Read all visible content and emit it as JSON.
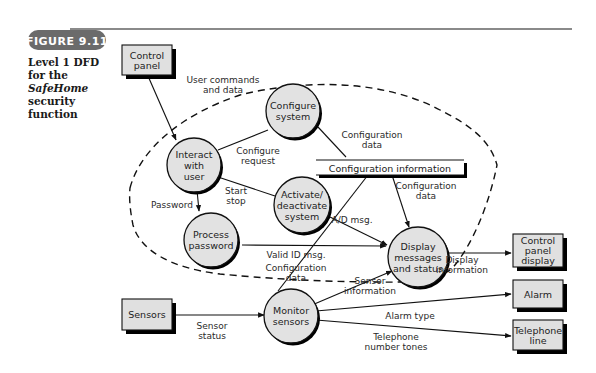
{
  "figure": {
    "badge": "FIGURE 9.11",
    "caption_prefix": "Level 1 DFD for the ",
    "caption_italic": "SafeHome",
    "caption_suffix": " security function"
  },
  "external_entities": [
    {
      "id": "control_panel",
      "lines": [
        "Control",
        "panel"
      ]
    },
    {
      "id": "sensors",
      "lines": [
        "Sensors"
      ]
    },
    {
      "id": "control_panel_display",
      "lines": [
        "Control",
        "panel",
        "display"
      ]
    },
    {
      "id": "alarm",
      "lines": [
        "Alarm"
      ]
    },
    {
      "id": "telephone_line",
      "lines": [
        "Telephone",
        "line"
      ]
    }
  ],
  "processes": [
    {
      "id": "interact_with_user",
      "lines": [
        "Interact",
        "with",
        "user"
      ]
    },
    {
      "id": "configure_system",
      "lines": [
        "Configure",
        "system"
      ]
    },
    {
      "id": "activate_deactivate_system",
      "lines": [
        "Activate/",
        "deactivate",
        "system"
      ]
    },
    {
      "id": "process_password",
      "lines": [
        "Process",
        "password"
      ]
    },
    {
      "id": "display_messages_and_status",
      "lines": [
        "Display",
        "messages",
        "and status"
      ]
    },
    {
      "id": "monitor_sensors",
      "lines": [
        "Monitor",
        "sensors"
      ]
    }
  ],
  "data_store": {
    "id": "configuration_information",
    "label": "Configuration information"
  },
  "flows": [
    {
      "id": "user_commands",
      "lines": [
        "User commands",
        "and data"
      ]
    },
    {
      "id": "configure_request",
      "lines": [
        "Configure",
        "request"
      ]
    },
    {
      "id": "configuration_data_to_store",
      "lines": [
        "Configuration",
        "data"
      ]
    },
    {
      "id": "start_stop",
      "lines": [
        "Start",
        "stop"
      ]
    },
    {
      "id": "password",
      "lines": [
        "Password"
      ]
    },
    {
      "id": "configuration_data_from_store",
      "lines": [
        "Configuration",
        "data"
      ]
    },
    {
      "id": "ad_msg",
      "lines": [
        "A/D msg."
      ]
    },
    {
      "id": "valid_id_msg",
      "lines": [
        "Valid ID msg."
      ]
    },
    {
      "id": "configuration_data_monitor",
      "lines": [
        "Configuration",
        "data"
      ]
    },
    {
      "id": "display_information",
      "lines": [
        "Display",
        "information"
      ]
    },
    {
      "id": "sensor_information",
      "lines": [
        "Sensor",
        "information"
      ]
    },
    {
      "id": "sensor_status",
      "lines": [
        "Sensor",
        "status"
      ]
    },
    {
      "id": "alarm_type",
      "lines": [
        "Alarm type"
      ]
    },
    {
      "id": "telephone_tones",
      "lines": [
        "Telephone",
        "number tones"
      ]
    }
  ],
  "colors": {
    "badge_bg": "#6b6b6b",
    "rule": "#8a8a8a",
    "bubble_fill": "#e2e2e2",
    "box_fill": "#e0e0e0",
    "stroke": "#111111",
    "shadow": "#000000"
  }
}
